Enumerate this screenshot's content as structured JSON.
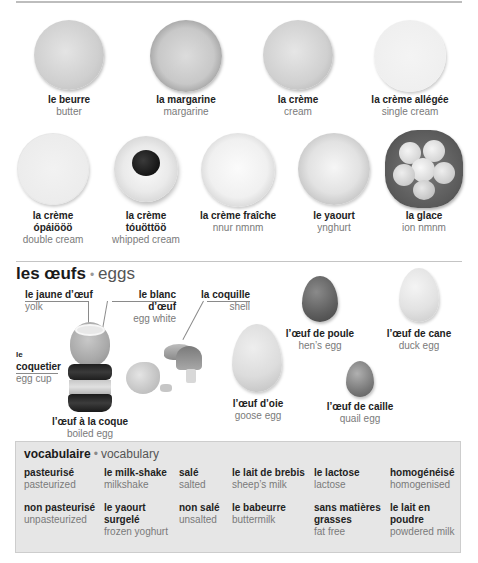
{
  "dairy": {
    "row1": [
      {
        "fr": "le beurre",
        "en": "butter"
      },
      {
        "fr": "la margarine",
        "en": "margarine"
      },
      {
        "fr": "la crème",
        "en": "cream"
      },
      {
        "fr": "la crème allégée",
        "en": "single cream"
      }
    ],
    "row2": [
      {
        "fr": "la crème",
        "fr2": "ópáiööö",
        "en": "double cream"
      },
      {
        "fr": "la crème",
        "fr2": "tóuöttöö",
        "en": "whipped cream"
      },
      {
        "fr": "la crème fraîche",
        "en": "nnur nmnm"
      },
      {
        "fr": "le yaourt",
        "en": "ynghurt"
      },
      {
        "fr": "la glace",
        "en": "ion nmnm"
      }
    ]
  },
  "eggs": {
    "title_fr": "les œufs",
    "title_sep": "•",
    "title_en": "eggs",
    "parts": {
      "yolk": {
        "fr": "le jaune d’œuf",
        "en": "yolk"
      },
      "white": {
        "fr": "le blanc d’œuf",
        "en": "egg white"
      },
      "shell": {
        "fr": "la coquille",
        "en": "shell"
      },
      "eggcup": {
        "fr1": "le",
        "fr2": "coquetier",
        "en": "egg cup"
      },
      "boiled": {
        "fr": "l’œuf à la coque",
        "en": "boiled egg"
      }
    },
    "types": {
      "hen": {
        "fr": "l’œuf de poule",
        "en": "hen’s egg"
      },
      "duck": {
        "fr": "l’œuf de cane",
        "en": "duck egg"
      },
      "goose": {
        "fr": "l’œuf d’oie",
        "en": "goose egg"
      },
      "quail": {
        "fr": "l’œuf de caille",
        "en": "quail egg"
      }
    }
  },
  "vocab": {
    "title_fr": "vocabulaire",
    "title_sep": "•",
    "title_en": "vocabulary",
    "row1": [
      {
        "fr": "pasteurisé",
        "en": "pasteurized"
      },
      {
        "fr": "le milk-shake",
        "en": "milkshake"
      },
      {
        "fr": "salé",
        "en": "salted"
      },
      {
        "fr": "le lait de brebis",
        "en": "sheep’s milk"
      },
      {
        "fr": "le lactose",
        "en": "lactose"
      },
      {
        "fr": "homogénéisé",
        "en": "homogenised"
      }
    ],
    "row2": [
      {
        "fr": "non pasteurisé",
        "en": "unpasteurized"
      },
      {
        "fr": "le yaourt",
        "fr2": "surgelé",
        "en": "frozen yoghurt"
      },
      {
        "fr": "non salé",
        "en": "unsalted"
      },
      {
        "fr": "le babeurre",
        "en": "buttermilk"
      },
      {
        "fr": "sans matières",
        "fr2": "grasses",
        "en": "fat free"
      },
      {
        "fr": "le lait en",
        "fr2": "poudre",
        "en": "powdered milk"
      }
    ]
  }
}
